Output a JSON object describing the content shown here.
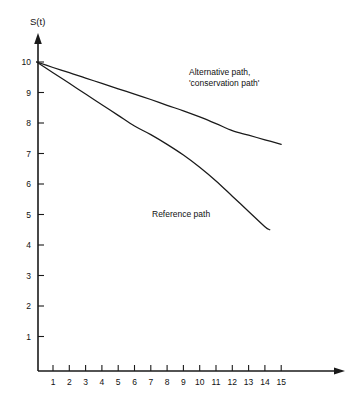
{
  "chart_data": {
    "type": "line",
    "title": "",
    "subtitle": "",
    "xlabel": "",
    "ylabel": "S(t)",
    "grid": false,
    "legend_position": "inline-annotation",
    "xlim": [
      0,
      16.5
    ],
    "ylim": [
      0,
      10.8
    ],
    "x_ticks": [
      1,
      2,
      3,
      4,
      5,
      6,
      7,
      8,
      9,
      10,
      11,
      12,
      13,
      14,
      15
    ],
    "y_ticks": [
      1,
      2,
      3,
      4,
      5,
      6,
      7,
      8,
      9,
      10
    ],
    "axis_style": "arrow-tipped open axes",
    "series": [
      {
        "name": "Alternative path, 'conservation path'",
        "color": "#1a1a1a",
        "x": [
          0,
          1,
          2,
          3,
          4,
          5,
          6,
          7,
          8,
          9,
          10,
          11,
          12,
          13,
          14,
          15
        ],
        "values": [
          10.0,
          9.82,
          9.65,
          9.47,
          9.3,
          9.12,
          8.95,
          8.77,
          8.58,
          8.4,
          8.2,
          7.98,
          7.75,
          7.6,
          7.45,
          7.3
        ]
      },
      {
        "name": "Reference path",
        "color": "#1a1a1a",
        "x": [
          0,
          1,
          2,
          3,
          4,
          5,
          6,
          7,
          8,
          9,
          10,
          11,
          12,
          13,
          14,
          14.3
        ],
        "values": [
          10.0,
          9.65,
          9.3,
          8.95,
          8.6,
          8.25,
          7.9,
          7.62,
          7.3,
          6.95,
          6.55,
          6.1,
          5.6,
          5.1,
          4.6,
          4.5
        ]
      }
    ],
    "annotations": [
      {
        "id": "alternative-path-label",
        "lines": [
          "Alternative path,",
          "'conservation path'"
        ],
        "x": 9.0,
        "y": 9.5
      },
      {
        "id": "reference-path-label",
        "lines": [
          "Reference path"
        ],
        "x": 7.3,
        "y": 5.2
      }
    ]
  }
}
